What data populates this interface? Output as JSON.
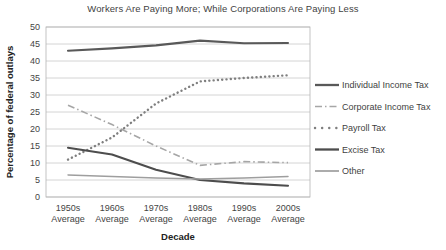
{
  "chart_data": {
    "type": "line",
    "title": "Workers Are Paying More; While Corporations Are Paying Less",
    "xlabel": "Decade",
    "ylabel": "Percentage of federal outlays",
    "categories": [
      "1950s\nAverage",
      "1960s\nAverage",
      "1970s\nAverage",
      "1980s\nAverage",
      "1990s\nAverage",
      "2000s\nAverage"
    ],
    "x_tick_top": [
      "1950s",
      "1960s",
      "1970s",
      "1980s",
      "1990s",
      "2000s"
    ],
    "x_tick_bottom": [
      "Average",
      "Average",
      "Average",
      "Average",
      "Average",
      "Average"
    ],
    "ylim": [
      0,
      50
    ],
    "yticks": [
      0,
      5,
      10,
      15,
      20,
      25,
      30,
      35,
      40,
      45,
      50
    ],
    "grid": true,
    "legend_position": "right",
    "series": [
      {
        "name": "Individual Income Tax",
        "style": "solid-thick",
        "color": "#595959",
        "values": [
          43.0,
          43.7,
          44.6,
          46.0,
          45.2,
          45.3
        ]
      },
      {
        "name": "Corporate Income Tax",
        "style": "dash-dot",
        "color": "#a6a6a6",
        "values": [
          27.0,
          21.3,
          15.0,
          9.3,
          10.4,
          10.1
        ]
      },
      {
        "name": "Payroll Tax",
        "style": "dotted",
        "color": "#7f7f7f",
        "values": [
          11.0,
          17.5,
          27.5,
          34.0,
          35.0,
          35.8
        ]
      },
      {
        "name": "Excise Tax",
        "style": "solid-thick",
        "color": "#4d4d4d",
        "values": [
          14.5,
          12.5,
          8.0,
          5.0,
          4.0,
          3.3
        ]
      },
      {
        "name": "Other",
        "style": "solid-thin",
        "color": "#9e9e9e",
        "values": [
          6.5,
          6.0,
          5.6,
          5.3,
          5.6,
          6.0
        ]
      }
    ]
  }
}
